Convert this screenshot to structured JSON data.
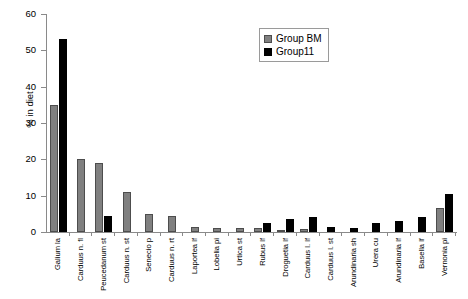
{
  "chart_data": {
    "type": "bar",
    "title": "",
    "xlabel": "",
    "ylabel": "% in diet",
    "ylim": [
      0,
      60
    ],
    "yticks": [
      0,
      10,
      20,
      30,
      40,
      50,
      60
    ],
    "grid": false,
    "legend_position": "top-right",
    "categories": [
      "Galium la",
      "Carduus n. fl",
      "Peucedanum st",
      "Carduus n. st",
      "Senecio p",
      "Carduus n. rt",
      "Laportea lf",
      "Lobelia pi",
      "Urtica st",
      "Rubus lf",
      "Droguetia lf",
      "Carduus l. lf",
      "Carduus l. st",
      "Arundinaria sh",
      "Urera cu",
      "Arundinaria lf",
      "Basella lf",
      "Vernonia pi"
    ],
    "series": [
      {
        "name": "Group BM",
        "color": "#808080",
        "values": [
          35,
          20,
          19,
          11,
          5,
          4.5,
          1.5,
          1.2,
          1.2,
          1,
          0.5,
          0.8,
          0,
          0,
          0,
          0,
          0,
          6.5
        ]
      },
      {
        "name": "Group11",
        "color": "#000000",
        "values": [
          53,
          0,
          4.5,
          0,
          0,
          0,
          0,
          0,
          0,
          2.5,
          3.5,
          4,
          1.5,
          1,
          2.5,
          3,
          4,
          10.5
        ]
      }
    ]
  },
  "legend": {
    "items": [
      {
        "label": "Group BM",
        "swatch": "gray-swatch-icon"
      },
      {
        "label": "Group11",
        "swatch": "black-swatch-icon"
      }
    ]
  }
}
